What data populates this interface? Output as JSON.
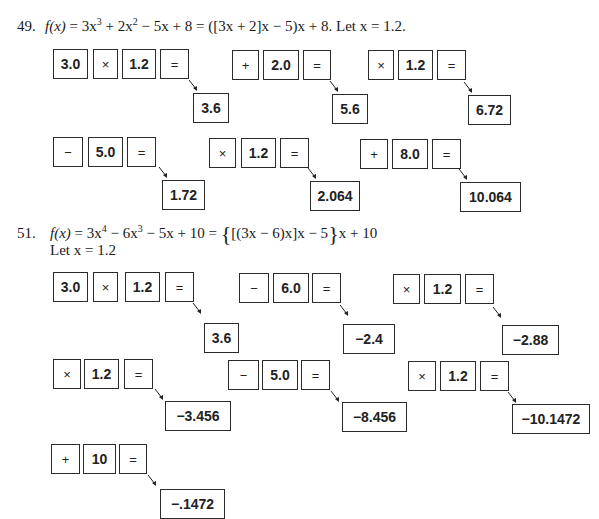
{
  "problems": [
    {
      "number": "49.",
      "formula_parts": {
        "lhs": "f(x)",
        "eq1": " = 3x",
        "exp1": "3",
        "t2": " + 2x",
        "exp2": "2",
        "rest": " − 5x + 8 = ([3x + 2]x − 5)x + 8.  Let x = 1.2."
      },
      "rows": [
        {
          "groups": [
            {
              "keys": [
                "3.0",
                "×",
                "1.2",
                "="
              ],
              "result": "3.6"
            },
            {
              "keys": [
                "+",
                "2.0",
                "="
              ],
              "result": "5.6"
            },
            {
              "keys": [
                "×",
                "1.2",
                "="
              ],
              "result": "6.72"
            }
          ]
        },
        {
          "groups": [
            {
              "keys": [
                "−",
                "5.0",
                "="
              ],
              "result": "1.72"
            },
            {
              "keys": [
                "×",
                "1.2",
                "="
              ],
              "result": "2.064"
            },
            {
              "keys": [
                "+",
                "8.0",
                "="
              ],
              "result": "10.064"
            }
          ]
        }
      ]
    },
    {
      "number": "51.",
      "formula_parts": {
        "lhs": "f(x)",
        "eq1": " = 3x",
        "exp1": "4",
        "t2": " − 6x",
        "exp2": "3",
        "rest": " − 5x + 10 = ",
        "brace_open": "{",
        "inner": "[(3x − 6)x]x − 5",
        "brace_close": "}",
        "tail": "x + 10",
        "let_line": "Let x = 1.2"
      },
      "rows": [
        {
          "groups": [
            {
              "keys": [
                "3.0",
                "×",
                "1.2",
                "="
              ],
              "result": "3.6"
            },
            {
              "keys": [
                "−",
                "6.0",
                "="
              ],
              "result": "−2.4"
            },
            {
              "keys": [
                "×",
                "1.2",
                "="
              ],
              "result": "−2.88"
            }
          ]
        },
        {
          "groups": [
            {
              "keys": [
                "×",
                "1.2",
                "="
              ],
              "result": "−3.456"
            },
            {
              "keys": [
                "−",
                "5.0",
                "="
              ],
              "result": "−8.456"
            },
            {
              "keys": [
                "×",
                "1.2",
                "="
              ],
              "result": "−10.1472"
            }
          ]
        },
        {
          "groups": [
            {
              "keys": [
                "+",
                "10",
                "="
              ],
              "result": "−.1472"
            }
          ]
        }
      ]
    }
  ]
}
